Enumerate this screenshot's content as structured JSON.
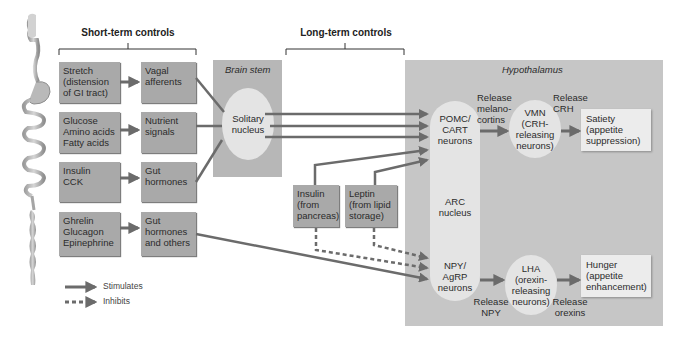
{
  "headers": {
    "short_term": "Short-term controls",
    "long_term": "Long-term controls"
  },
  "regions": {
    "brain_stem": "Brain stem",
    "hypothalamus": "Hypothalamus"
  },
  "short_term_rows": [
    {
      "stimulus": "Stretch (distension of GI tract)",
      "stimulus_lines": [
        "Stretch",
        "(distension",
        "of GI tract)"
      ],
      "signal_lines": [
        "Vagal",
        "afferents"
      ]
    },
    {
      "stimulus": "Glucose Amino acids Fatty acids",
      "stimulus_lines": [
        "Glucose",
        "Amino acids",
        "Fatty acids"
      ],
      "signal_lines": [
        "Nutrient",
        "signals"
      ]
    },
    {
      "stimulus": "Insulin CCK",
      "stimulus_lines": [
        "Insulin",
        "CCK"
      ],
      "signal_lines": [
        "Gut",
        "hormones"
      ]
    },
    {
      "stimulus": "Ghrelin Glucagon Epinephrine",
      "stimulus_lines": [
        "Ghrelin",
        "Glucagon",
        "Epinephrine"
      ],
      "signal_lines": [
        "Gut",
        "hormones",
        "and others"
      ]
    }
  ],
  "solitary_nucleus": [
    "Solitary",
    "nucleus"
  ],
  "long_term": {
    "insulin": [
      "Insulin",
      "(from",
      "pancreas)"
    ],
    "leptin": [
      "Leptin",
      "(from lipid",
      "storage)"
    ]
  },
  "hypothalamus": {
    "pomc": [
      "POMC/",
      "CART",
      "neurons"
    ],
    "arc": [
      "ARC",
      "nucleus"
    ],
    "npy": [
      "NPY/",
      "AgRP",
      "neurons"
    ],
    "release_melanocortins": [
      "Release",
      "melano-",
      "cortins"
    ],
    "vmn": [
      "VMN",
      "(CRH-",
      "releasing",
      "neurons)"
    ],
    "release_crh": [
      "Release",
      "CRH"
    ],
    "satiety": [
      "Satiety",
      "(appetite",
      "suppression)"
    ],
    "release_npy": [
      "Release",
      "NPY"
    ],
    "lha": [
      "LHA",
      "(orexin-",
      "releasing",
      "neurons)"
    ],
    "release_orexins": [
      "Release",
      "orexins"
    ],
    "hunger": [
      "Hunger",
      "(appetite",
      "enhancement)"
    ]
  },
  "legend": {
    "stimulates": "Stimulates",
    "inhibits": "Inhibits"
  },
  "colors": {
    "arrow": "#6b6b6b",
    "box": "#a9a9a9",
    "brain_stem": "#b7b7b7",
    "hypothalamus": "#c6c6c6",
    "ellipse": "#e4e4e4",
    "output_box": "#ececec"
  }
}
